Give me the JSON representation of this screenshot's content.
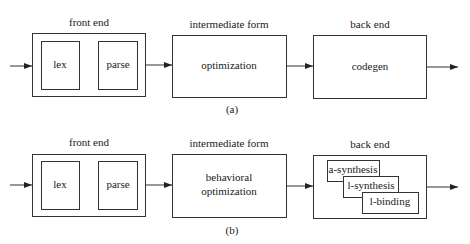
{
  "diagram_a": {
    "stage_labels": {
      "front_end": "front end",
      "intermediate": "intermediate form",
      "back_end": "back end"
    },
    "front_end": {
      "blocks": [
        "lex",
        "parse"
      ]
    },
    "intermediate": {
      "block": "optimization"
    },
    "back_end": {
      "block": "codegen"
    },
    "caption": "(a)"
  },
  "diagram_b": {
    "stage_labels": {
      "front_end": "front end",
      "intermediate": "intermediate form",
      "back_end": "back end"
    },
    "front_end": {
      "blocks": [
        "lex",
        "parse"
      ]
    },
    "intermediate": {
      "block_line1": "behavioral",
      "block_line2": "optimization"
    },
    "back_end": {
      "blocks": [
        "a-synthesis",
        "l-synthesis",
        "l-binding"
      ]
    },
    "caption": "(b)"
  }
}
